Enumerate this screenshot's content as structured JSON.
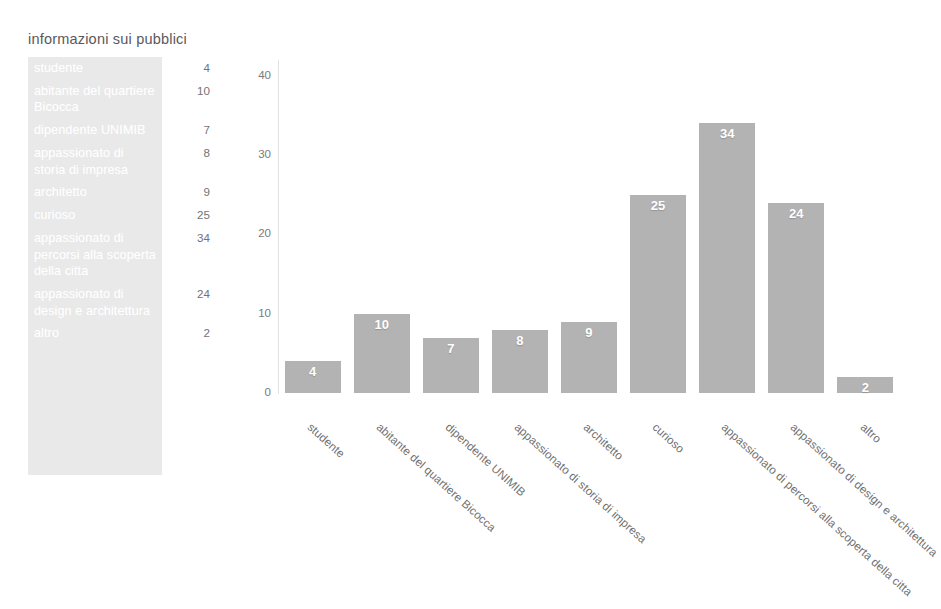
{
  "summary": {
    "title": "informazioni sui pubblici",
    "rows": [
      {
        "label": "studente",
        "value": "4"
      },
      {
        "label": "abitante del quartiere Bicocca",
        "value": "10"
      },
      {
        "label": "dipendente UNIMIB",
        "value": "7"
      },
      {
        "label": "appassionato di storia di impresa",
        "value": "8"
      },
      {
        "label": "architetto",
        "value": "9"
      },
      {
        "label": "curioso",
        "value": "25"
      },
      {
        "label": "appassionato di percorsi alla scoperta della citta",
        "value": "34"
      },
      {
        "label": "appassionato di design e architettura",
        "value": "24"
      },
      {
        "label": "altro",
        "value": "2"
      }
    ]
  },
  "chart_data": {
    "type": "bar",
    "title": "informazioni sui pubblici",
    "xlabel": "",
    "ylabel": "",
    "ylim": [
      0,
      42
    ],
    "yticks": [
      0,
      10,
      20,
      30,
      40
    ],
    "ytick_labels": [
      "0",
      "10",
      "20",
      "30",
      "40"
    ],
    "grid": false,
    "legend": false,
    "bar_color": "#b3b3b3",
    "value_label_color": "#ffffff",
    "categories": [
      "studente",
      "abitante del quartiere Bicocca",
      "dipendente UNIMIB",
      "appassionato di storia di impresa",
      "architetto",
      "curioso",
      "appassionato di percorsi alla scoperta della citta",
      "appassionato di design e architettura",
      "altro"
    ],
    "values": [
      4,
      10,
      7,
      8,
      9,
      25,
      34,
      24,
      2
    ],
    "data_labels": [
      "4",
      "10",
      "7",
      "8",
      "9",
      "25",
      "34",
      "24",
      "2"
    ]
  }
}
